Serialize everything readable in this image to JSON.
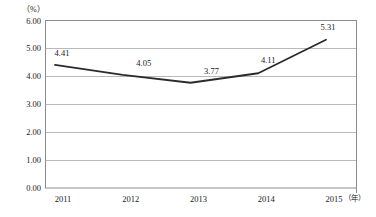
{
  "chart_data": {
    "type": "line",
    "title": "",
    "xlabel": "（年）",
    "ylabel": "（%）",
    "categories": [
      "2011",
      "2012",
      "2013",
      "2014",
      "2015"
    ],
    "values": [
      4.41,
      4.05,
      3.77,
      4.11,
      5.31
    ],
    "point_labels": [
      "4.41",
      "4.05",
      "3.77",
      "4.11",
      "5.31"
    ],
    "ylim": [
      0.0,
      6.0
    ],
    "ytick_labels": [
      "6.00",
      "5.00",
      "4.00",
      "3.00",
      "2.00",
      "1.00",
      "0.00"
    ],
    "ytick_values": [
      6.0,
      5.0,
      4.0,
      3.0,
      2.0,
      1.0,
      0.0
    ],
    "grid": true,
    "grid_axis": "y",
    "legend": null,
    "series": [
      {
        "name": "",
        "values": [
          4.41,
          4.05,
          3.77,
          4.11,
          5.31
        ]
      }
    ],
    "colors": {
      "line": "#2b2b2b",
      "grid": "#b9b9b9",
      "frame": "#8c8c8c",
      "background": "#ffffff",
      "text": "#1a1a1a"
    }
  }
}
